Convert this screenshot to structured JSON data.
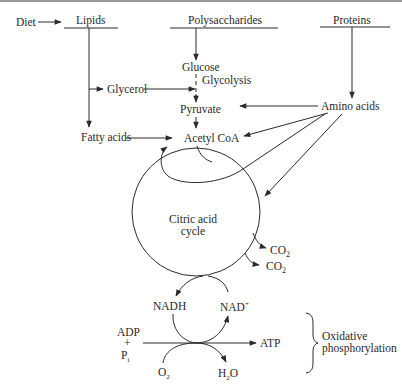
{
  "diagram": {
    "sources": {
      "diet": "Diet",
      "lipids": "Lipids",
      "polysaccharides": "Polysaccharides",
      "proteins": "Proteins"
    },
    "intermediates": {
      "glucose": "Glucose",
      "glycolysis": "Glycolysis",
      "glycerol": "Glycerol",
      "pyruvate": "Pyruvate",
      "amino_acids": "Amino acids",
      "fatty_acids": "Fatty acids",
      "acetyl_coa": "Acetyl CoA"
    },
    "cycle": {
      "line1": "Citric acid",
      "line2": "cycle",
      "co2_a": "CO",
      "co2_b": "CO",
      "co2_sub": "2"
    },
    "oxphos": {
      "nadh": "NADH",
      "nad": "NAD",
      "nad_sup": "+",
      "adp": "ADP",
      "plus": "+",
      "pi": "P",
      "pi_sub": "i",
      "atp": "ATP",
      "o2": "O",
      "o2_sub": "2",
      "h2o_h": "H",
      "h2o_sub": "2",
      "h2o_o": "O",
      "label_line1": "Oxidative",
      "label_line2": "phosphorylation"
    },
    "colors": {
      "line": "#2a2a2a",
      "background": "#ffffff",
      "top_border": "#9a9a9a"
    }
  }
}
